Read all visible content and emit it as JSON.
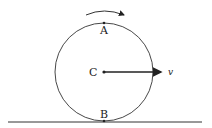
{
  "diagram": {
    "type": "rolling-wheel",
    "labels": {
      "top_point": "A",
      "center": "C",
      "bottom_point": "B",
      "velocity": "v"
    },
    "rotation_arrow": "clockwise",
    "colors": {
      "stroke": "#333333",
      "background": "#ffffff"
    }
  }
}
